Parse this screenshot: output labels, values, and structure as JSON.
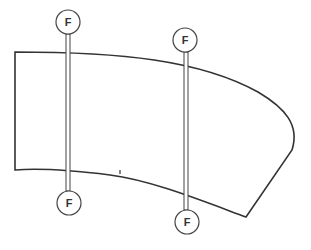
{
  "diagram": {
    "markers": [
      {
        "id": "rod-1-top",
        "label": "F"
      },
      {
        "id": "rod-1-bottom",
        "label": "F"
      },
      {
        "id": "rod-2-top",
        "label": "F"
      },
      {
        "id": "rod-2-bottom",
        "label": "F"
      }
    ],
    "colors": {
      "line": "#333333",
      "background": "#ffffff"
    }
  }
}
